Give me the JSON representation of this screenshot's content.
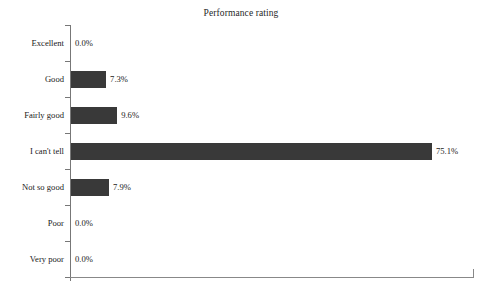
{
  "chart_data": {
    "type": "bar",
    "orientation": "horizontal",
    "title": "Performance rating",
    "xlabel": "",
    "ylabel": "",
    "grid": false,
    "legend": false,
    "value_suffix": "%",
    "xlim": [
      0,
      75.1
    ],
    "categories": [
      "Excellent",
      "Good",
      "Fairly good",
      "I can't tell",
      "Not so good",
      "Poor",
      "Very poor"
    ],
    "values": [
      0.0,
      7.3,
      9.6,
      75.1,
      7.9,
      0.0,
      0.0
    ],
    "value_labels": [
      "0.0%",
      "7.3%",
      "9.6%",
      "75.1%",
      "7.9%",
      "0.0%",
      "0.0%"
    ]
  },
  "style": {
    "bar_color": "#393939",
    "axis_color": "#808080",
    "text_color": "#1a1a1a",
    "background": "#ffffff"
  }
}
